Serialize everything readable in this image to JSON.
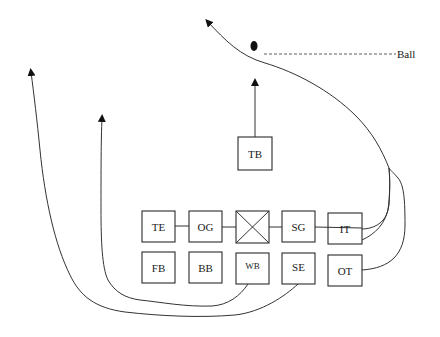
{
  "diagram": {
    "type": "football-play-diagram",
    "ball": {
      "label": "Ball"
    },
    "center_symbol": "X-box",
    "line_of_scrimmage": [
      {
        "id": "TE",
        "label": "TE"
      },
      {
        "id": "OG",
        "label": "OG"
      },
      {
        "id": "C",
        "label": ""
      },
      {
        "id": "SG",
        "label": "SG"
      },
      {
        "id": "IT",
        "label": "IT"
      }
    ],
    "backfield_row": [
      {
        "id": "FB",
        "label": "FB"
      },
      {
        "id": "BB",
        "label": "BB"
      },
      {
        "id": "WB",
        "label": "WB"
      },
      {
        "id": "SE",
        "label": "SE"
      },
      {
        "id": "OT",
        "label": "OT"
      }
    ],
    "tailback": {
      "id": "TB",
      "label": "TB"
    },
    "routes": [
      {
        "from": "TB",
        "direction": "straight-up"
      },
      {
        "from": "IT",
        "direction": "curve-right-then-up-left"
      },
      {
        "from": "OT",
        "direction": "curve-right-then-up-left"
      },
      {
        "from": "WB",
        "direction": "sweep-left-then-up"
      },
      {
        "from": "SE",
        "direction": "sweep-left-then-up"
      }
    ],
    "colors": {
      "line": "#333333",
      "background": "#ffffff",
      "text": "#1a1a1a"
    }
  }
}
